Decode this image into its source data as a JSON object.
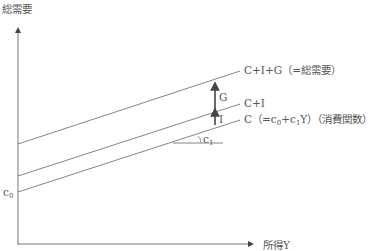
{
  "diagram": {
    "title": "",
    "y_axis_label": "総需要",
    "x_axis_label": "所得Y",
    "lines": [
      {
        "id": "cig",
        "label": "C+I+G（=総需要）"
      },
      {
        "id": "ci",
        "label": "C+I"
      },
      {
        "id": "c",
        "label_main": "C（=c",
        "label_sub0": "0",
        "label_mid": "+c",
        "label_sub1": "1",
        "label_tail": "Y）（消費関数）"
      }
    ],
    "arrows": [
      {
        "id": "G",
        "label": "G"
      },
      {
        "id": "I",
        "label": "I"
      }
    ],
    "intercept_label": {
      "main": "c",
      "sub": "0"
    },
    "slope_label": {
      "main": "c",
      "sub": "1"
    },
    "colors": {
      "line": "#777777",
      "arrow": "#444444",
      "text": "#555555"
    }
  }
}
